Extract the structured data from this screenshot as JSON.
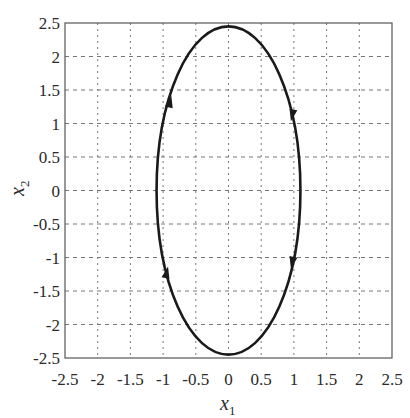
{
  "chart_data": {
    "type": "line",
    "title": "",
    "xlabel": "x_1",
    "ylabel": "x_2",
    "xlim": [
      -2.5,
      2.5
    ],
    "ylim": [
      -2.5,
      2.5
    ],
    "grid": true,
    "x_ticks": [
      "-2.5",
      "-2",
      "-1.5",
      "-1",
      "-0.5",
      "0",
      "0.5",
      "1",
      "1.5",
      "2",
      "2.5"
    ],
    "y_ticks": [
      "2.5",
      "2",
      "1.5",
      "1",
      "0.5",
      "0",
      "-0.5",
      "-1",
      "-1.5",
      "-2",
      "-2.5"
    ],
    "series": [
      {
        "name": "phase trajectory (closed orbit)",
        "shape": "ellipse",
        "center": [
          0,
          0
        ],
        "semi_axis_x1": 1.1,
        "semi_axis_x2": 2.45,
        "direction": "clockwise",
        "color": "#1a1a1a",
        "arrows": [
          {
            "x": -0.9,
            "y": 1.3,
            "direction": "up"
          },
          {
            "x": 0.98,
            "y": 1.15,
            "direction": "down"
          },
          {
            "x": 0.98,
            "y": -1.05,
            "direction": "down"
          },
          {
            "x": -0.95,
            "y": -1.25,
            "direction": "up"
          }
        ]
      }
    ]
  },
  "labels": {
    "xlabel_main": "x",
    "xlabel_sub": "1",
    "ylabel_main": "x",
    "ylabel_sub": "2"
  }
}
